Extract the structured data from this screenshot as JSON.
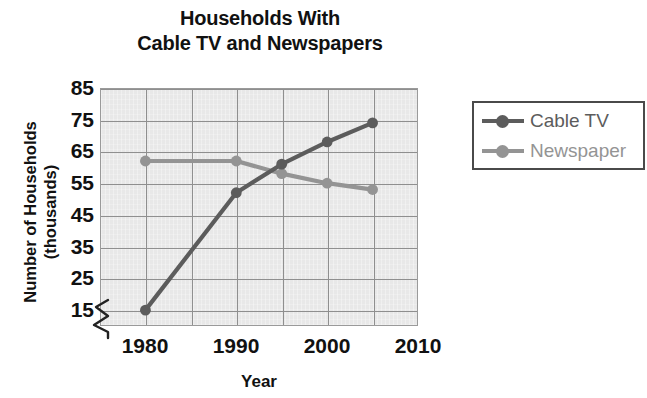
{
  "title": {
    "line1": "Households With",
    "line2": "Cable TV and Newspapers"
  },
  "axes": {
    "y_title_line1": "Number of Households",
    "y_title_line2": "(thousands)",
    "x_title": "Year",
    "y_ticks": [
      "85",
      "75",
      "65",
      "55",
      "45",
      "35",
      "25",
      "15"
    ],
    "x_ticks": [
      "1980",
      "1990",
      "2000",
      "2010"
    ]
  },
  "legend": {
    "items": [
      {
        "label": "Cable TV",
        "color": "#5c5c5c"
      },
      {
        "label": "Newspaper",
        "color": "#949494"
      }
    ]
  },
  "colors": {
    "cable_tv": "#5c5c5c",
    "newspaper": "#949494",
    "gridline": "#8f8f8f",
    "plot_background": "#e8e8e8",
    "axis_text": "#111111",
    "legend_border": "#4a4a4a"
  },
  "chart_data": {
    "type": "line",
    "title": "Households With Cable TV and Newspapers",
    "xlabel": "Year",
    "ylabel": "Number of Households (thousands)",
    "x": [
      1980,
      1990,
      1995,
      2000,
      2005
    ],
    "xlim": [
      1975,
      2010
    ],
    "ylim": [
      10,
      85
    ],
    "y_axis_break": true,
    "grid": true,
    "legend_position": "right",
    "y_tick_values": [
      15,
      25,
      35,
      45,
      55,
      65,
      75,
      85
    ],
    "x_tick_values": [
      1980,
      1990,
      2000,
      2010
    ],
    "x_gridline_values": [
      1980,
      1985,
      1990,
      1995,
      2000,
      2005,
      2010
    ],
    "series": [
      {
        "name": "Cable TV",
        "color": "#5c5c5c",
        "values": [
          15,
          52,
          61,
          68,
          74
        ]
      },
      {
        "name": "Newspaper",
        "color": "#949494",
        "values": [
          62,
          62,
          58,
          55,
          53
        ]
      }
    ]
  }
}
